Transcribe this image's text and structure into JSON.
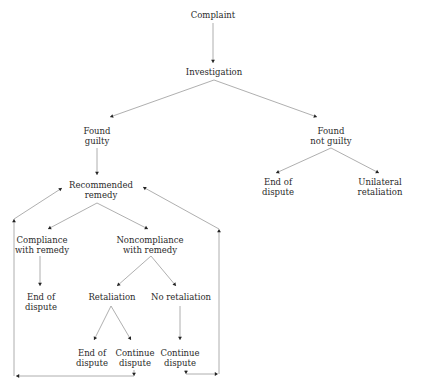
{
  "diagram": {
    "type": "flowchart",
    "nodes": [
      {
        "id": "complaint",
        "label": "Complaint"
      },
      {
        "id": "investigation",
        "label": "Investigation"
      },
      {
        "id": "found_guilty",
        "label": "Found\nguilty"
      },
      {
        "id": "found_not_guilty",
        "label": "Found\nnot guilty"
      },
      {
        "id": "recommended_remedy",
        "label": "Recommended\nremedy"
      },
      {
        "id": "end_dispute_ng",
        "label": "End of\ndispute"
      },
      {
        "id": "unilateral_retaliation",
        "label": "Unilateral\nretaliation"
      },
      {
        "id": "compliance",
        "label": "Compliance\nwith remedy"
      },
      {
        "id": "noncompliance",
        "label": "Noncompliance\nwith remedy"
      },
      {
        "id": "end_dispute_c",
        "label": "End of\ndispute"
      },
      {
        "id": "retaliation",
        "label": "Retaliation"
      },
      {
        "id": "no_retaliation",
        "label": "No retaliation"
      },
      {
        "id": "end_dispute_r",
        "label": "End of\ndispute"
      },
      {
        "id": "continue_dispute_r",
        "label": "Continue\ndispute"
      },
      {
        "id": "continue_dispute_nr",
        "label": "Continue\ndispute"
      }
    ],
    "edges": [
      {
        "from": "complaint",
        "to": "investigation"
      },
      {
        "from": "investigation",
        "to": "found_guilty"
      },
      {
        "from": "investigation",
        "to": "found_not_guilty"
      },
      {
        "from": "found_guilty",
        "to": "recommended_remedy"
      },
      {
        "from": "found_not_guilty",
        "to": "end_dispute_ng"
      },
      {
        "from": "found_not_guilty",
        "to": "unilateral_retaliation"
      },
      {
        "from": "recommended_remedy",
        "to": "compliance"
      },
      {
        "from": "recommended_remedy",
        "to": "noncompliance"
      },
      {
        "from": "compliance",
        "to": "end_dispute_c"
      },
      {
        "from": "noncompliance",
        "to": "retaliation"
      },
      {
        "from": "noncompliance",
        "to": "no_retaliation"
      },
      {
        "from": "retaliation",
        "to": "end_dispute_r"
      },
      {
        "from": "retaliation",
        "to": "continue_dispute_r"
      },
      {
        "from": "no_retaliation",
        "to": "continue_dispute_nr"
      },
      {
        "from": "continue_dispute_r",
        "to": "recommended_remedy",
        "kind": "loop-left"
      },
      {
        "from": "continue_dispute_nr",
        "to": "recommended_remedy",
        "kind": "loop-right"
      }
    ]
  },
  "colors": {
    "line": "#9a9a9a",
    "arrowhead": "#222222",
    "text": "#2a2a2a",
    "background": "#ffffff"
  }
}
